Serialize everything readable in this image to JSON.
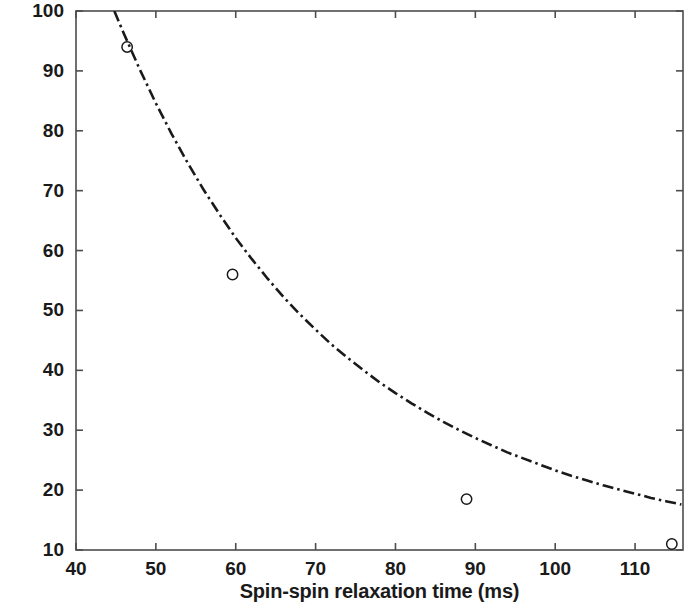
{
  "chart_data": {
    "type": "line",
    "title": "",
    "xlabel": "Spin-spin relaxation time (ms)",
    "ylabel": "Viscosity (mPa s)",
    "xlim": [
      40,
      116
    ],
    "ylim": [
      10,
      100
    ],
    "xticks": [
      40,
      50,
      60,
      70,
      80,
      90,
      100,
      110
    ],
    "yticks": [
      10,
      20,
      30,
      40,
      50,
      60,
      70,
      80,
      90,
      100
    ],
    "xtick_labels": [
      "40",
      "50",
      "60",
      "70",
      "80",
      "90",
      "100",
      "110"
    ],
    "ytick_labels": [
      "10",
      "20",
      "30",
      "40",
      "50",
      "60",
      "70",
      "80",
      "90",
      "100"
    ],
    "grid": false,
    "legend": null,
    "series": [
      {
        "name": "measured data",
        "type": "scatter",
        "marker": "open-circle",
        "marker_color": "#1a1a1a",
        "x": [
          46.4,
          59.6,
          88.9,
          114.6
        ],
        "y": [
          94.0,
          56.0,
          18.5,
          11.0
        ]
      },
      {
        "name": "fitted curve",
        "type": "line",
        "linestyle": "dash-dot",
        "line_color": "#1a1a1a",
        "x": [
          44.8,
          46.0,
          48.0,
          50.0,
          52.0,
          54.0,
          56.0,
          58.0,
          60.0,
          62.0,
          64.0,
          66.0,
          68.0,
          70.0,
          72.0,
          74.0,
          76.0,
          78.0,
          80.0,
          82.0,
          84.0,
          86.0,
          88.0,
          90.0,
          92.0,
          94.0,
          96.0,
          98.0,
          100.0,
          102.0,
          104.0,
          106.0,
          108.0,
          110.0,
          112.0,
          114.0,
          115.8
        ],
        "y": [
          100.0,
          96.2,
          90.2,
          84.6,
          79.4,
          74.6,
          70.1,
          66.0,
          62.1,
          58.6,
          55.3,
          52.2,
          49.4,
          46.8,
          44.3,
          42.1,
          40.0,
          38.0,
          36.2,
          34.5,
          32.9,
          31.4,
          30.0,
          28.7,
          27.5,
          26.3,
          25.3,
          24.3,
          23.3,
          22.4,
          21.6,
          20.8,
          20.1,
          19.4,
          18.7,
          18.1,
          17.6
        ]
      }
    ],
    "axis_box": true,
    "tick_direction": "in",
    "axis_color": "#4d4d4d"
  }
}
